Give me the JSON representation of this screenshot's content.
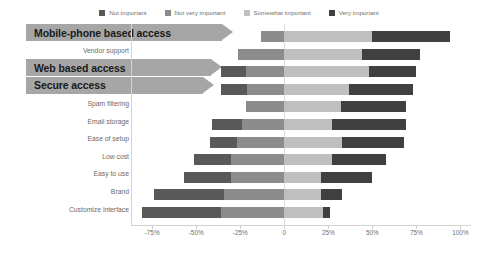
{
  "legend": {
    "position": "top-center",
    "items": [
      {
        "label": "Not important",
        "color": "#595959",
        "icon": "square-swatch-icon"
      },
      {
        "label": "Not very important",
        "color": "#8c8c8c",
        "icon": "square-swatch-icon"
      },
      {
        "label": "Somewhat important",
        "color": "#bfbfbf",
        "icon": "square-swatch-icon"
      },
      {
        "label": "Very important",
        "color": "#404040",
        "icon": "square-swatch-icon"
      }
    ]
  },
  "axis": {
    "ticks": [
      "-75%",
      "-50%",
      "-25%",
      "0",
      "25%",
      "50%",
      "75%",
      "100%"
    ],
    "tick_values": [
      -75,
      -50,
      -25,
      0,
      25,
      50,
      75,
      100
    ],
    "min": -87,
    "max": 106
  },
  "chart_data": {
    "type": "bar",
    "subtype": "diverging-stacked-bar",
    "title": "",
    "xlabel": "",
    "ylabel": "",
    "xlim": [
      -87,
      106
    ],
    "grid": false,
    "legend_position": "top-center",
    "categories": [
      "Mobile-phone based access",
      "Vendor support",
      "Web based access",
      "Secure access",
      "Spam filtering",
      "Email storage",
      "Ease of setup",
      "Low cost",
      "Easy to use",
      "Brand",
      "Customize interface"
    ],
    "series": [
      {
        "name": "Not important",
        "color": "#595959",
        "values": [
          0,
          0,
          -14,
          -15,
          0,
          -17,
          -15,
          -8,
          -15,
          -40,
          -44
        ]
      },
      {
        "name": "Not very important",
        "color": "#8c8c8c",
        "values": [
          -13,
          -26,
          -22,
          -21,
          -22,
          -24,
          -27,
          -30,
          -30,
          -34,
          -36
        ]
      },
      {
        "name": "Somewhat important",
        "color": "#bfbfbf",
        "values": [
          63,
          70,
          66,
          58,
          54,
          51,
          58,
          60,
          51,
          50,
          52
        ]
      },
      {
        "name": "Very important",
        "color": "#404040",
        "values": [
          44,
          33,
          27,
          36,
          38,
          42,
          36,
          31,
          29,
          12,
          4
        ]
      }
    ],
    "bars": [
      {
        "category": "Mobile-phone based access",
        "start": -13,
        "mid": 50,
        "end": 94
      },
      {
        "category": "Vendor support",
        "start": -26,
        "mid": 44,
        "end": 77
      },
      {
        "category": "Web based access",
        "start": -36,
        "mid": 48,
        "end": 75
      },
      {
        "category": "Secure access",
        "start": -36,
        "mid": 37,
        "end": 73
      },
      {
        "category": "Spam filtering",
        "start": -22,
        "mid": 32,
        "end": 69
      },
      {
        "category": "Email storage",
        "start": -41,
        "mid": 27,
        "end": 69
      },
      {
        "category": "Ease of setup",
        "start": -42,
        "mid": 33,
        "end": 68
      },
      {
        "category": "Low cost",
        "start": -51,
        "mid": 27,
        "end": 58
      },
      {
        "category": "Easy to use",
        "start": -57,
        "mid": 21,
        "end": 50
      },
      {
        "category": "Brand",
        "start": -74,
        "mid": 21,
        "end": 33
      },
      {
        "category": "Customize interface",
        "start": -81,
        "mid": 22,
        "end": 26
      }
    ],
    "splits": [
      {
        "category": "Mobile-phone based access",
        "neg_split": -13
      },
      {
        "category": "Vendor support",
        "neg_split": -26
      },
      {
        "category": "Web based access",
        "neg_split": -22
      },
      {
        "category": "Secure access",
        "neg_split": -21
      },
      {
        "category": "Spam filtering",
        "neg_split": -22
      },
      {
        "category": "Email storage",
        "neg_split": -24
      },
      {
        "category": "Ease of setup",
        "neg_split": -27
      },
      {
        "category": "Low cost",
        "neg_split": -30
      },
      {
        "category": "Easy to use",
        "neg_split": -30
      },
      {
        "category": "Brand",
        "neg_split": -34
      },
      {
        "category": "Customize interface",
        "neg_split": -36
      }
    ]
  },
  "row_labels": [
    {
      "text": "Mobile-phone based access",
      "style": "banner"
    },
    {
      "text": "Vendor support",
      "style": "plain"
    },
    {
      "text": "Web based access",
      "style": "banner"
    },
    {
      "text": "Secure access",
      "style": "banner"
    },
    {
      "text": "Spam filtering",
      "style": "plain"
    },
    {
      "text": "Email storage",
      "style": "plain"
    },
    {
      "text": "Ease of setup",
      "style": "plain"
    },
    {
      "text": "Low cost",
      "style": "plain"
    },
    {
      "text": "Easy to use",
      "style": "plain"
    },
    {
      "text": "Brand",
      "style": "plain"
    },
    {
      "text": "Customize interface",
      "style": "plain"
    }
  ],
  "colors": {
    "banner_fill": "#a6a6a6",
    "axis": "#d3d3d3",
    "text": "#6f6f6f"
  }
}
